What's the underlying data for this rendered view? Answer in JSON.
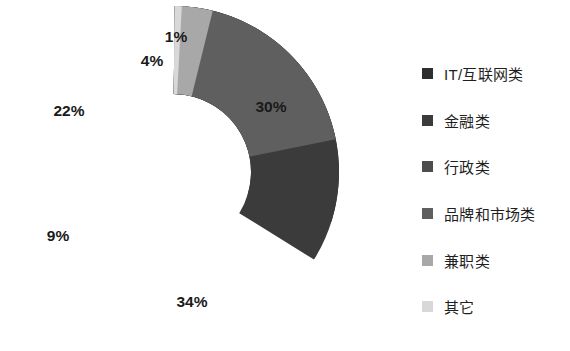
{
  "chart_data": {
    "type": "pie",
    "variant": "donut",
    "title": "",
    "subtitle": "",
    "xlabel": "",
    "ylabel": "",
    "grid": false,
    "legend_position": "right",
    "start_angle_deg": 0,
    "direction": "clockwise",
    "units": "percent",
    "categories": [
      "IT/互联网类",
      "金融类",
      "行政类",
      "品牌和市场类",
      "兼职类",
      "其它"
    ],
    "values": [
      30,
      34,
      9,
      22,
      4,
      1
    ],
    "labels": [
      "30%",
      "34%",
      "9%",
      "22%",
      "4%",
      "1%"
    ],
    "colors": [
      "#2e2e2e",
      "#3b3b3b",
      "#4d4d4d",
      "#5f5f5f",
      "#a8a8a8",
      "#d8d8d8"
    ],
    "slices": [
      {
        "name": "IT/互联网类",
        "value": 30,
        "label": "30%",
        "color": "#2e2e2e"
      },
      {
        "name": "金融类",
        "value": 34,
        "label": "34%",
        "color": "#3b3b3b"
      },
      {
        "name": "行政类",
        "value": 9,
        "label": "9%",
        "color": "#4d4d4d"
      },
      {
        "name": "品牌和市场类",
        "value": 22,
        "label": "22%",
        "color": "#5f5f5f"
      },
      {
        "name": "兼职类",
        "value": 4,
        "label": "4%",
        "color": "#a8a8a8"
      },
      {
        "name": "其它",
        "value": 1,
        "label": "1%",
        "color": "#d8d8d8"
      }
    ]
  },
  "legend": {
    "items": [
      {
        "label": "IT/互联网类",
        "color": "#2e2e2e"
      },
      {
        "label": "金融类",
        "color": "#3b3b3b"
      },
      {
        "label": "行政类",
        "color": "#4d4d4d"
      },
      {
        "label": "品牌和市场类",
        "color": "#5f5f5f"
      },
      {
        "label": "兼职类",
        "color": "#a8a8a8"
      },
      {
        "label": "其它",
        "color": "#d8d8d8"
      }
    ]
  },
  "style": {
    "background": "#ffffff",
    "separator_color": "#ffffff",
    "label_color": "#1a1a1a"
  }
}
